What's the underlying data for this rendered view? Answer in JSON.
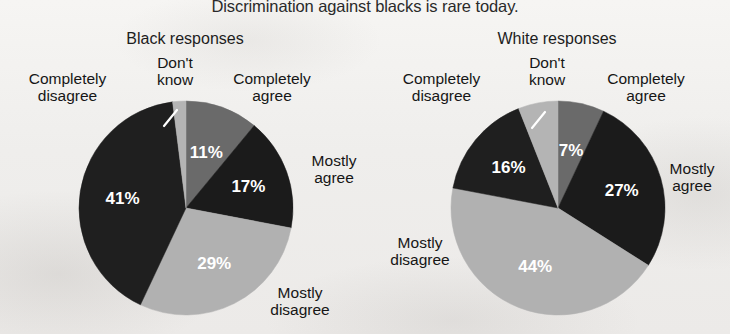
{
  "figure": {
    "title": "Discrimination against blacks is rare today.",
    "colors": {
      "completely_agree": "#6a6a6a",
      "mostly_agree": "#1b1b1b",
      "mostly_disagree": "#b1b1b1",
      "completely_disagree": "#1f1f1f",
      "dont_know": "#b4b4b4",
      "background": "#f3f2f0",
      "text": "#161616",
      "value_text": "#ffffff"
    }
  },
  "chart_data": [
    {
      "type": "pie",
      "title": "Black responses",
      "categories": [
        "Completely agree",
        "Mostly agree",
        "Mostly disagree",
        "Completely disagree",
        "Don't know"
      ],
      "values": [
        11,
        17,
        29,
        41,
        2
      ],
      "value_labels": [
        "11%",
        "17%",
        "29%",
        "41%",
        "2%"
      ],
      "colors": [
        "#6a6a6a",
        "#1b1b1b",
        "#b1b1b1",
        "#1f1f1f",
        "#b4b4b4"
      ],
      "start_angle_deg": 0,
      "direction": "clockwise",
      "legend": "callout-labels",
      "grid": false
    },
    {
      "type": "pie",
      "title": "White responses",
      "categories": [
        "Completely agree",
        "Mostly agree",
        "Mostly disagree",
        "Completely disagree",
        "Don't know"
      ],
      "values": [
        7,
        27,
        44,
        16,
        6
      ],
      "value_labels": [
        "7%",
        "27%",
        "44%",
        "16%",
        "6%"
      ],
      "colors": [
        "#6a6a6a",
        "#1b1b1b",
        "#b1b1b1",
        "#1f1f1f",
        "#b4b4b4"
      ],
      "start_angle_deg": 0,
      "direction": "clockwise",
      "legend": "callout-labels",
      "grid": false
    }
  ],
  "left_chart": {
    "title": "Black responses",
    "labels": {
      "completely_disagree": "Completely\ndisagree",
      "dont_know": "Don't\nknow",
      "completely_agree": "Completely\nagree",
      "mostly_agree": "Mostly\nagree",
      "mostly_disagree": "Mostly\ndisagree"
    },
    "label_completely_disagree_l1": "Completely",
    "label_completely_disagree_l2": "disagree",
    "label_dont_know_l1": "Don't",
    "label_dont_know_l2": "know",
    "label_completely_agree_l1": "Completely",
    "label_completely_agree_l2": "agree",
    "label_mostly_agree_l1": "Mostly",
    "label_mostly_agree_l2": "agree",
    "label_mostly_disagree_l1": "Mostly",
    "label_mostly_disagree_l2": "disagree",
    "pct_completely_agree": "11%",
    "pct_mostly_agree": "17%",
    "pct_mostly_disagree": "29%",
    "pct_completely_disagree": "41%",
    "pct_dont_know": "2%"
  },
  "right_chart": {
    "title": "White responses",
    "label_completely_disagree_l1": "Completely",
    "label_completely_disagree_l2": "disagree",
    "label_dont_know_l1": "Don't",
    "label_dont_know_l2": "know",
    "label_completely_agree_l1": "Completely",
    "label_completely_agree_l2": "agree",
    "label_mostly_agree_l1": "Mostly",
    "label_mostly_agree_l2": "agree",
    "label_mostly_disagree_l1": "Mostly",
    "label_mostly_disagree_l2": "disagree",
    "pct_completely_agree": "7%",
    "pct_mostly_agree": "27%",
    "pct_mostly_disagree": "44%",
    "pct_completely_disagree": "16%",
    "pct_dont_know": "6%"
  }
}
